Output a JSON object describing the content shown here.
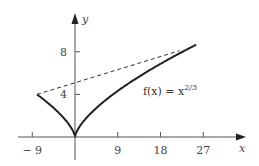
{
  "chart_data": {
    "type": "line",
    "title": "",
    "xlabel": "x",
    "ylabel": "y",
    "xlim": [
      -10,
      31
    ],
    "ylim": [
      -2,
      12
    ],
    "x_ticks": [
      -9,
      9,
      18,
      27
    ],
    "x_tick_labels": [
      "− 9",
      "9",
      "18",
      "27"
    ],
    "y_ticks": [
      4,
      8
    ],
    "y_tick_labels": [
      "4",
      "8"
    ],
    "grid": false,
    "legend": "none",
    "series": [
      {
        "name": "f(x) = x^(2/3)",
        "style": "solid",
        "function": "x^(2/3)",
        "domain": [
          -8,
          25.5
        ],
        "x": [
          -8,
          -6,
          -4,
          -2,
          -1,
          -0.3,
          0,
          0.3,
          1,
          2,
          4,
          6,
          8,
          12,
          16,
          20,
          25.5
        ],
        "values": [
          4,
          3.3,
          2.52,
          1.59,
          1,
          0.45,
          0,
          0.45,
          1,
          1.59,
          2.52,
          3.3,
          4,
          5.24,
          6.35,
          7.37,
          8.66
        ]
      },
      {
        "name": "secant",
        "style": "dashed",
        "x": [
          -8,
          22
        ],
        "values": [
          4,
          8.1
        ]
      }
    ],
    "annotations": [
      {
        "text": "f(x) = x",
        "superscript": "2/3",
        "x": 14,
        "y": 4
      }
    ]
  },
  "labels": {
    "x_axis": "x",
    "y_axis": "y",
    "x_ticks": [
      "− 9",
      "9",
      "18",
      "27"
    ],
    "y_ticks": [
      "4",
      "8"
    ],
    "function_main": "f(x) = x",
    "function_exp": "2/3"
  }
}
